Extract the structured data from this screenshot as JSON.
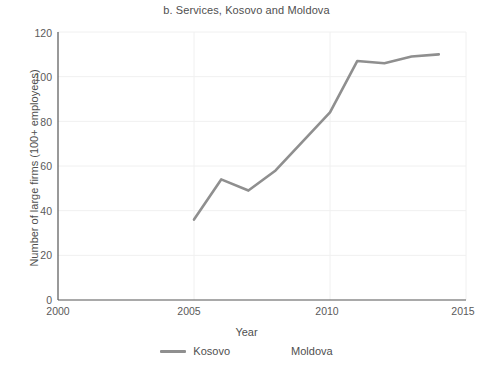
{
  "chart_data": {
    "type": "line",
    "title": "b. Services, Kosovo and Moldova",
    "xlabel": "Year",
    "ylabel": "Number of large firms (100+ employees)",
    "xlim": [
      2000,
      2015
    ],
    "ylim": [
      0,
      120
    ],
    "xticks": [
      "2000",
      "2005",
      "2010",
      "2015"
    ],
    "yticks": [
      "0",
      "20",
      "40",
      "60",
      "80",
      "100",
      "120"
    ],
    "grid": true,
    "legend_position": "bottom",
    "series": [
      {
        "name": "Kosovo",
        "color": "#8f8f8f",
        "x": [
          2005,
          2006,
          2007,
          2008,
          2009,
          2010,
          2011,
          2012,
          2013,
          2014
        ],
        "values": [
          36,
          54,
          49,
          58,
          71,
          84,
          107,
          106,
          109,
          110
        ]
      },
      {
        "name": "Moldova",
        "color": "#ffffff",
        "x": [],
        "values": []
      }
    ]
  },
  "legend": {
    "items": [
      {
        "label": "Kosovo",
        "color": "#8f8f8f"
      },
      {
        "label": "Moldova",
        "color": "#ffffff"
      }
    ]
  },
  "axis": {
    "line_color": "#555555",
    "grid_color": "#f0f0f0"
  }
}
